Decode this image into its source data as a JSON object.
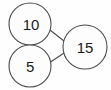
{
  "diagram": {
    "type": "number-bond",
    "background_color": "#fefefe",
    "stroke_color": "#4a4a4a",
    "text_color": "#1b1b1b",
    "nodes": [
      {
        "id": "part-top",
        "label": "10",
        "value": 10,
        "role": "part",
        "cx": 30,
        "cy": 24,
        "r": 21
      },
      {
        "id": "part-bottom",
        "label": "5",
        "value": 5,
        "role": "part",
        "cx": 30,
        "cy": 66,
        "r": 21
      },
      {
        "id": "whole",
        "label": "15",
        "value": 15,
        "role": "whole",
        "cx": 85,
        "cy": 47,
        "r": 22
      }
    ],
    "edges": [
      {
        "id": "edge-top",
        "from": "part-top",
        "to": "whole",
        "x1": 50,
        "y1": 30,
        "x2": 64,
        "y2": 41
      },
      {
        "id": "edge-bottom",
        "from": "part-bottom",
        "to": "whole",
        "x1": 49,
        "y1": 63,
        "x2": 64,
        "y2": 53
      }
    ]
  }
}
